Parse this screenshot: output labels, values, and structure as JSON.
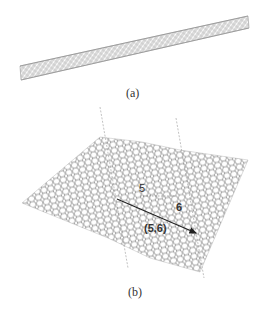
{
  "panels": [
    {
      "id": "a",
      "caption": "(a)",
      "description": "carbon nanotube"
    },
    {
      "id": "b",
      "caption": "(b)",
      "description": "graphene sheet with chiral vector",
      "labels": {
        "n": "5",
        "m": "6",
        "vector": "(5,6)"
      }
    }
  ],
  "colors": {
    "lattice": "#8a8a8a",
    "arrow": "#222222",
    "dashed": "#999999",
    "text": "#333333"
  }
}
